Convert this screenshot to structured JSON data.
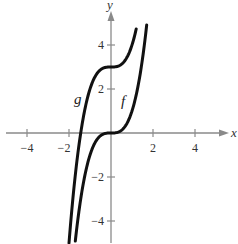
{
  "chart_data": {
    "type": "line",
    "title": "",
    "xlabel": "x",
    "ylabel": "y",
    "xlim": [
      -5,
      5.5
    ],
    "ylim": [
      -5,
      5.5
    ],
    "grid": false,
    "x_ticks": [
      -4,
      -2,
      2,
      4
    ],
    "y_ticks": [
      -4,
      -2,
      2,
      4
    ],
    "x_tick_labels": [
      "−4",
      "−2",
      "2",
      "4"
    ],
    "y_tick_labels": [
      "−4",
      "−2",
      "2",
      "4"
    ],
    "series": [
      {
        "name": "g",
        "equation": "g(x) = x^3 + 3",
        "x": [
          -2.0,
          -1.8,
          -1.6,
          -1.4,
          -1.2,
          -1.0,
          -0.8,
          -0.6,
          -0.4,
          -0.2,
          0.0,
          0.2,
          0.4,
          0.6,
          0.8,
          1.0,
          1.2
        ],
        "values": [
          -5.0,
          -2.83,
          -1.1,
          0.26,
          1.27,
          2.0,
          2.49,
          2.78,
          2.94,
          2.99,
          3.0,
          3.01,
          3.06,
          3.22,
          3.51,
          4.0,
          4.73
        ]
      },
      {
        "name": "f",
        "equation": "f(x) = x^3",
        "x": [
          -1.7,
          -1.5,
          -1.3,
          -1.1,
          -0.9,
          -0.7,
          -0.5,
          -0.3,
          -0.1,
          0.0,
          0.1,
          0.3,
          0.5,
          0.7,
          0.9,
          1.1,
          1.3,
          1.5,
          1.7
        ],
        "values": [
          -4.91,
          -3.38,
          -2.2,
          -1.33,
          -0.73,
          -0.34,
          -0.13,
          -0.03,
          0.0,
          0.0,
          0.0,
          0.03,
          0.13,
          0.34,
          0.73,
          1.33,
          2.2,
          3.38,
          4.91
        ]
      }
    ],
    "annotations": [
      {
        "text": "g",
        "near": "left curve, x≈-1.5, y≈1.5"
      },
      {
        "text": "f",
        "near": "right curve, x≈0.6, y≈1.3"
      }
    ],
    "legend": "none (curves labeled inline)"
  },
  "labels": {
    "x_axis": "x",
    "y_axis": "y",
    "curve_g": "g",
    "curve_f": "f",
    "xt_m4": "−4",
    "xt_m2": "−2",
    "xt_2": "2",
    "xt_4": "4",
    "yt_4": "4",
    "yt_2": "2",
    "yt_m2": "−2",
    "yt_m4": "−4"
  },
  "colors": {
    "axis": "#8a8a8a",
    "curve": "#111111",
    "background": "#ffffff"
  }
}
